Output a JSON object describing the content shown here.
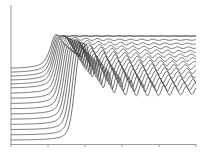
{
  "chart_data": {
    "type": "line",
    "title": "",
    "xlabel": "",
    "ylabel": "",
    "grid": false,
    "legend": null,
    "style": "stacked waterfall of spectra (absorption-edge-like step with post-edge oscillations)",
    "n_series": 16,
    "x_ticks": [
      "",
      "",
      "",
      "",
      "",
      ""
    ],
    "xlim": [
      0,
      5
    ],
    "series_description": "Each trace: flat low pre-edge baseline, sharp rising edge near x≈1.0–1.7, white-line peak, then damped oscillations settling to a flat post-edge level. Traces are vertically offset; lower traces have edges shifted right and larger oscillation amplitude.",
    "series": [
      {
        "name": "trace 1",
        "pre_edge": 0.0,
        "edge_x": 1.72,
        "post_edge": 0.38,
        "osc_amp": 0.1
      },
      {
        "name": "trace 2",
        "pre_edge": 0.04,
        "edge_x": 1.66,
        "post_edge": 0.41,
        "osc_amp": 0.095
      },
      {
        "name": "trace 3",
        "pre_edge": 0.08,
        "edge_x": 1.6,
        "post_edge": 0.44,
        "osc_amp": 0.09
      },
      {
        "name": "trace 4",
        "pre_edge": 0.12,
        "edge_x": 1.54,
        "post_edge": 0.47,
        "osc_amp": 0.085
      },
      {
        "name": "trace 5",
        "pre_edge": 0.16,
        "edge_x": 1.49,
        "post_edge": 0.5,
        "osc_amp": 0.08
      },
      {
        "name": "trace 6",
        "pre_edge": 0.2,
        "edge_x": 1.44,
        "post_edge": 0.53,
        "osc_amp": 0.07
      },
      {
        "name": "trace 7",
        "pre_edge": 0.24,
        "edge_x": 1.39,
        "post_edge": 0.56,
        "osc_amp": 0.065
      },
      {
        "name": "trace 8",
        "pre_edge": 0.28,
        "edge_x": 1.34,
        "post_edge": 0.59,
        "osc_amp": 0.055
      },
      {
        "name": "trace 9",
        "pre_edge": 0.32,
        "edge_x": 1.3,
        "post_edge": 0.62,
        "osc_amp": 0.05
      },
      {
        "name": "trace 10",
        "pre_edge": 0.36,
        "edge_x": 1.26,
        "post_edge": 0.65,
        "osc_amp": 0.04
      },
      {
        "name": "trace 11",
        "pre_edge": 0.4,
        "edge_x": 1.22,
        "post_edge": 0.68,
        "osc_amp": 0.035
      },
      {
        "name": "trace 12",
        "pre_edge": 0.43,
        "edge_x": 1.18,
        "post_edge": 0.71,
        "osc_amp": 0.025
      },
      {
        "name": "trace 13",
        "pre_edge": 0.46,
        "edge_x": 1.15,
        "post_edge": 0.74,
        "osc_amp": 0.02
      },
      {
        "name": "trace 14",
        "pre_edge": 0.49,
        "edge_x": 1.12,
        "post_edge": 0.77,
        "osc_amp": 0.012
      },
      {
        "name": "trace 15",
        "pre_edge": 0.52,
        "edge_x": 1.09,
        "post_edge": 0.8,
        "osc_amp": 0.006
      },
      {
        "name": "trace 16",
        "pre_edge": 0.55,
        "edge_x": 1.06,
        "post_edge": 0.8,
        "osc_amp": 0.0
      }
    ]
  },
  "colors": {
    "line": "#3a3a3a",
    "axis": "#9a9a9a",
    "background": "#ffffff"
  }
}
